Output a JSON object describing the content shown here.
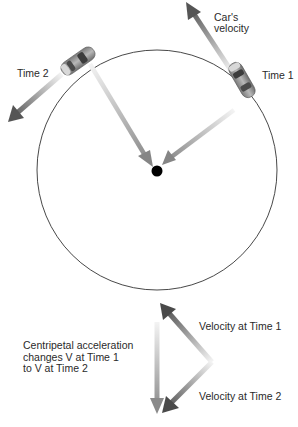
{
  "diagram": {
    "labels": {
      "cars_velocity_line1": "Car's",
      "cars_velocity_line2": "velocity",
      "time1": "Time 1",
      "time2": "Time 2",
      "velocity_time1": "Velocity at Time 1",
      "velocity_time2": "Velocity at Time 2",
      "centripetal_line1": "Centripetal acceleration",
      "centripetal_line2": "changes V at Time 1",
      "centripetal_line3": "to V at Time 2"
    },
    "colors": {
      "circle": "#333333",
      "center_dot": "#000000",
      "arrow_dark": "#555555",
      "arrow_light": "#f2f2f2",
      "radial_arrow": "#8a8a8a",
      "car_body": "#9a9a9a"
    },
    "circle": {
      "cx": 157,
      "cy": 170,
      "r": 120
    }
  }
}
